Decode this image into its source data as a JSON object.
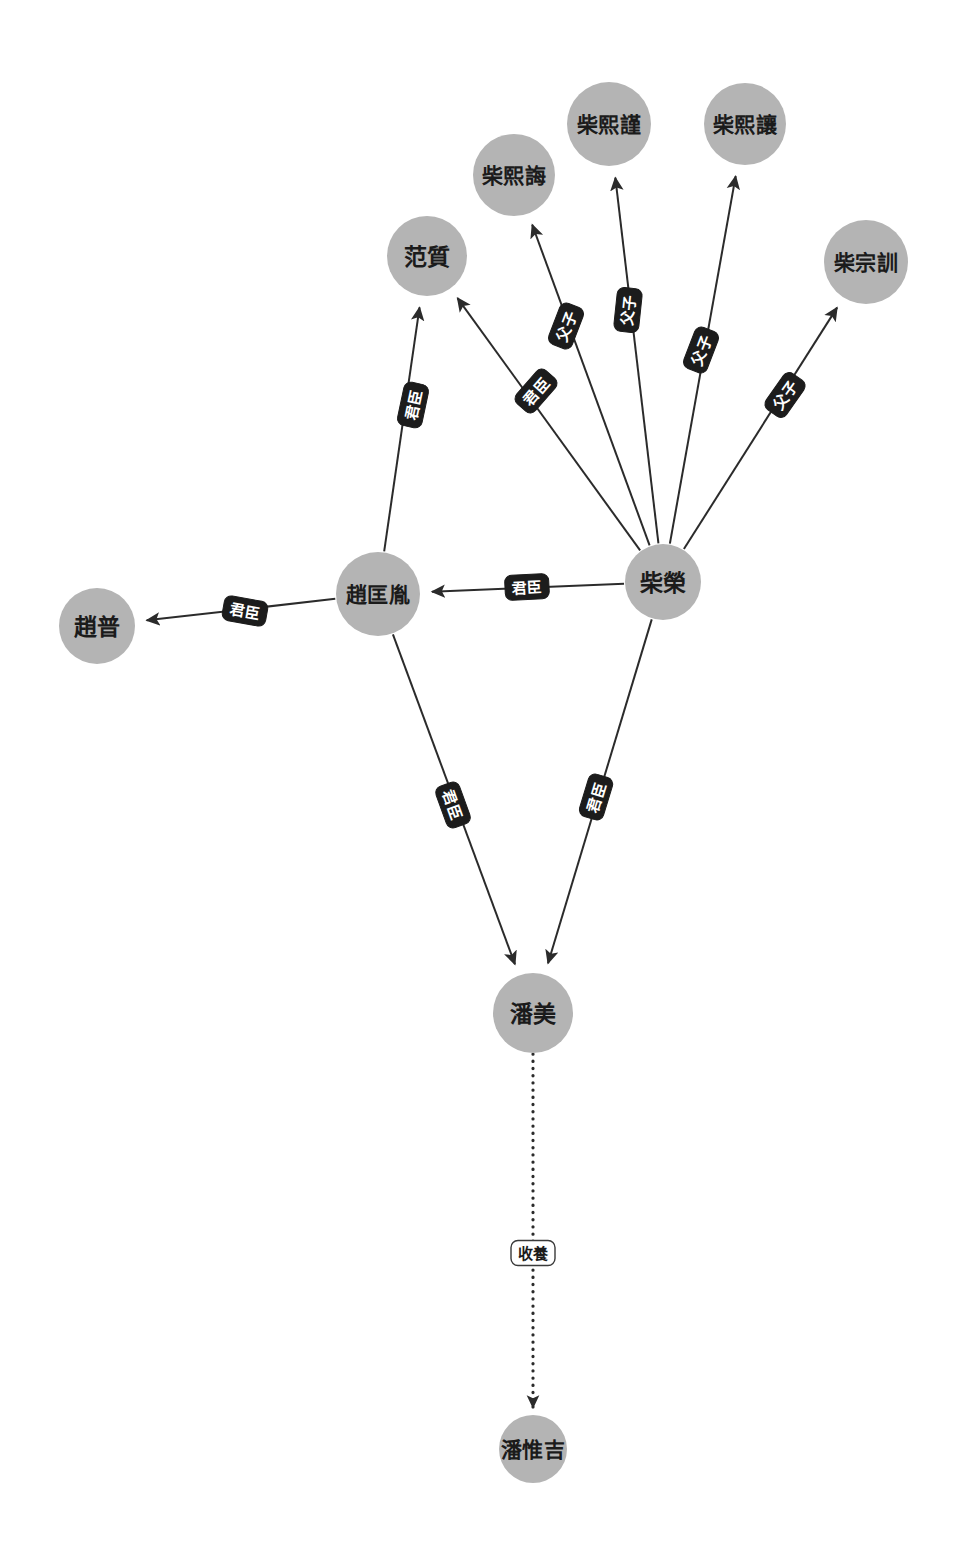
{
  "graph": {
    "type": "directed-node-link-diagram",
    "background_color": "#ffffff",
    "node_fill_color": "#b4b4b4",
    "node_text_color": "#1b1b1b",
    "edge_color": "#2b2b2b",
    "edge_label_fill": "#1c1c1c",
    "edge_label_text_color": "#ffffff",
    "nodes": [
      {
        "id": "chaixijin",
        "label": "柴熙謹",
        "x": 609,
        "y": 124,
        "r": 42
      },
      {
        "id": "chaixirang",
        "label": "柴熙讓",
        "x": 745,
        "y": 124,
        "r": 41
      },
      {
        "id": "chaixihui",
        "label": "柴熙誨",
        "x": 514,
        "y": 175,
        "r": 41
      },
      {
        "id": "chaizongxun",
        "label": "柴宗訓",
        "x": 866,
        "y": 262,
        "r": 42
      },
      {
        "id": "fanzhi",
        "label": "范質",
        "x": 427,
        "y": 256,
        "r": 40
      },
      {
        "id": "zhaokuangyin",
        "label": "趙匡胤",
        "x": 378,
        "y": 594,
        "r": 42
      },
      {
        "id": "chairong",
        "label": "柴榮",
        "x": 663,
        "y": 582,
        "r": 38
      },
      {
        "id": "zhaopu",
        "label": "趙普",
        "x": 97,
        "y": 626,
        "r": 38
      },
      {
        "id": "panmei",
        "label": "潘美",
        "x": 533,
        "y": 1013,
        "r": 40
      },
      {
        "id": "panweiji",
        "label": "潘惟吉",
        "x": 533,
        "y": 1449,
        "r": 34
      }
    ],
    "edges": [
      {
        "id": "e1",
        "source": "zhaokuangyin",
        "target": "fanzhi",
        "label": "君臣",
        "style": "solid",
        "label_x": 413,
        "label_y": 405,
        "label_rotate": -78
      },
      {
        "id": "e2",
        "source": "chairong",
        "target": "fanzhi",
        "label": "君臣",
        "style": "solid",
        "label_x": 536,
        "label_y": 391,
        "label_rotate": -49
      },
      {
        "id": "e3",
        "source": "chairong",
        "target": "chaixihui",
        "label": "父子",
        "style": "solid",
        "label_x": 566,
        "label_y": 326,
        "label_rotate": -69
      },
      {
        "id": "e4",
        "source": "chairong",
        "target": "chaixijin",
        "label": "父子",
        "style": "solid",
        "label_x": 628,
        "label_y": 310,
        "label_rotate": -84
      },
      {
        "id": "e5",
        "source": "chairong",
        "target": "chaixirang",
        "label": "父子",
        "style": "solid",
        "label_x": 701,
        "label_y": 350,
        "label_rotate": -69
      },
      {
        "id": "e6",
        "source": "chairong",
        "target": "chaizongxun",
        "label": "父子",
        "style": "solid",
        "label_x": 785,
        "label_y": 395,
        "label_rotate": -55
      },
      {
        "id": "e7",
        "source": "chairong",
        "target": "zhaokuangyin",
        "label": "君臣",
        "style": "solid",
        "label_x": 527,
        "label_y": 587,
        "label_rotate": -3
      },
      {
        "id": "e8",
        "source": "zhaokuangyin",
        "target": "zhaopu",
        "label": "君臣",
        "style": "solid",
        "label_x": 245,
        "label_y": 611,
        "label_rotate": 10
      },
      {
        "id": "e9",
        "source": "zhaokuangyin",
        "target": "panmei",
        "label": "君臣",
        "style": "solid",
        "label_x": 453,
        "label_y": 805,
        "label_rotate": 70
      },
      {
        "id": "e10",
        "source": "chairong",
        "target": "panmei",
        "label": "君臣",
        "style": "solid",
        "label_x": 596,
        "label_y": 797,
        "label_rotate": -73
      },
      {
        "id": "e11",
        "source": "panmei",
        "target": "panweiji",
        "label": "收養",
        "style": "dotted",
        "label_x": 533,
        "label_y": 1253,
        "label_rotate": 0,
        "label_variant": "light"
      }
    ]
  }
}
